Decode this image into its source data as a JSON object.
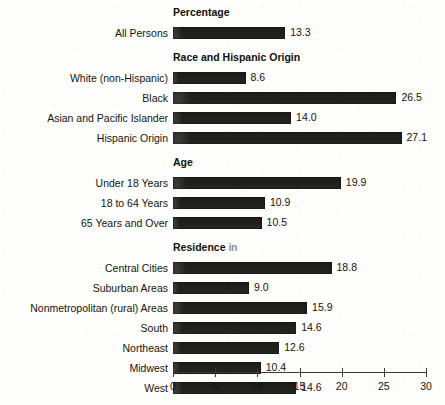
{
  "chart_data": {
    "type": "bar",
    "orientation": "horizontal",
    "title": "",
    "xlabel": "",
    "ylabel": "",
    "xlim": [
      0,
      30
    ],
    "xticks": [
      0,
      5,
      10,
      15,
      20,
      25,
      30
    ],
    "grid": false,
    "legend": null,
    "value_label_format": "one_decimal",
    "bar_color": "#1d1c18",
    "background_color": "#fdfdfc",
    "sections": [
      {
        "heading": "Percentage",
        "heading_partial": false,
        "categories": [
          "All Persons"
        ],
        "values": [
          13.3
        ]
      },
      {
        "heading": "Race and Hispanic Origin",
        "heading_partial": false,
        "categories": [
          "White (non-Hispanic)",
          "Black",
          "Asian and Pacific Islander",
          "Hispanic Origin"
        ],
        "values": [
          8.6,
          26.5,
          14.0,
          27.1
        ]
      },
      {
        "heading": "Age",
        "heading_partial": false,
        "categories": [
          "Under 18 Years",
          "18 to 64 Years",
          "65 Years and Over"
        ],
        "values": [
          19.9,
          10.9,
          10.5
        ]
      },
      {
        "heading": "Residence in",
        "heading_visible_prefix": "Residence ",
        "heading_faded_suffix": "in",
        "heading_partial": true,
        "categories": [
          "Central Cities",
          "Suburban Areas",
          "Nonmetropolitan (rural) Areas",
          "South",
          "Northeast",
          "Midwest",
          "West"
        ],
        "values": [
          18.8,
          9.0,
          15.9,
          14.6,
          12.6,
          10.4,
          14.6
        ]
      }
    ],
    "categories": [
      "All Persons",
      "White (non-Hispanic)",
      "Black",
      "Asian and Pacific Islander",
      "Hispanic Origin",
      "Under 18 Years",
      "18 to 64 Years",
      "65 Years and Over",
      "Central Cities",
      "Suburban Areas",
      "Nonmetropolitan (rural) Areas",
      "South",
      "Northeast",
      "Midwest",
      "West"
    ],
    "values": [
      13.3,
      8.6,
      26.5,
      14.0,
      27.1,
      19.9,
      10.9,
      10.5,
      18.8,
      9.0,
      15.9,
      14.6,
      12.6,
      10.4,
      14.6
    ]
  },
  "axis": {
    "tick_labels": [
      "0",
      "5",
      "10",
      "15",
      "20",
      "25",
      "30"
    ]
  }
}
